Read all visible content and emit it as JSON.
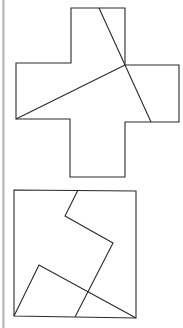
{
  "figure": {
    "panels": [
      {
        "name": "cross",
        "shape": "greek-cross",
        "cut_lines": 2
      },
      {
        "name": "square",
        "shape": "square",
        "cut_lines": 2
      }
    ]
  }
}
